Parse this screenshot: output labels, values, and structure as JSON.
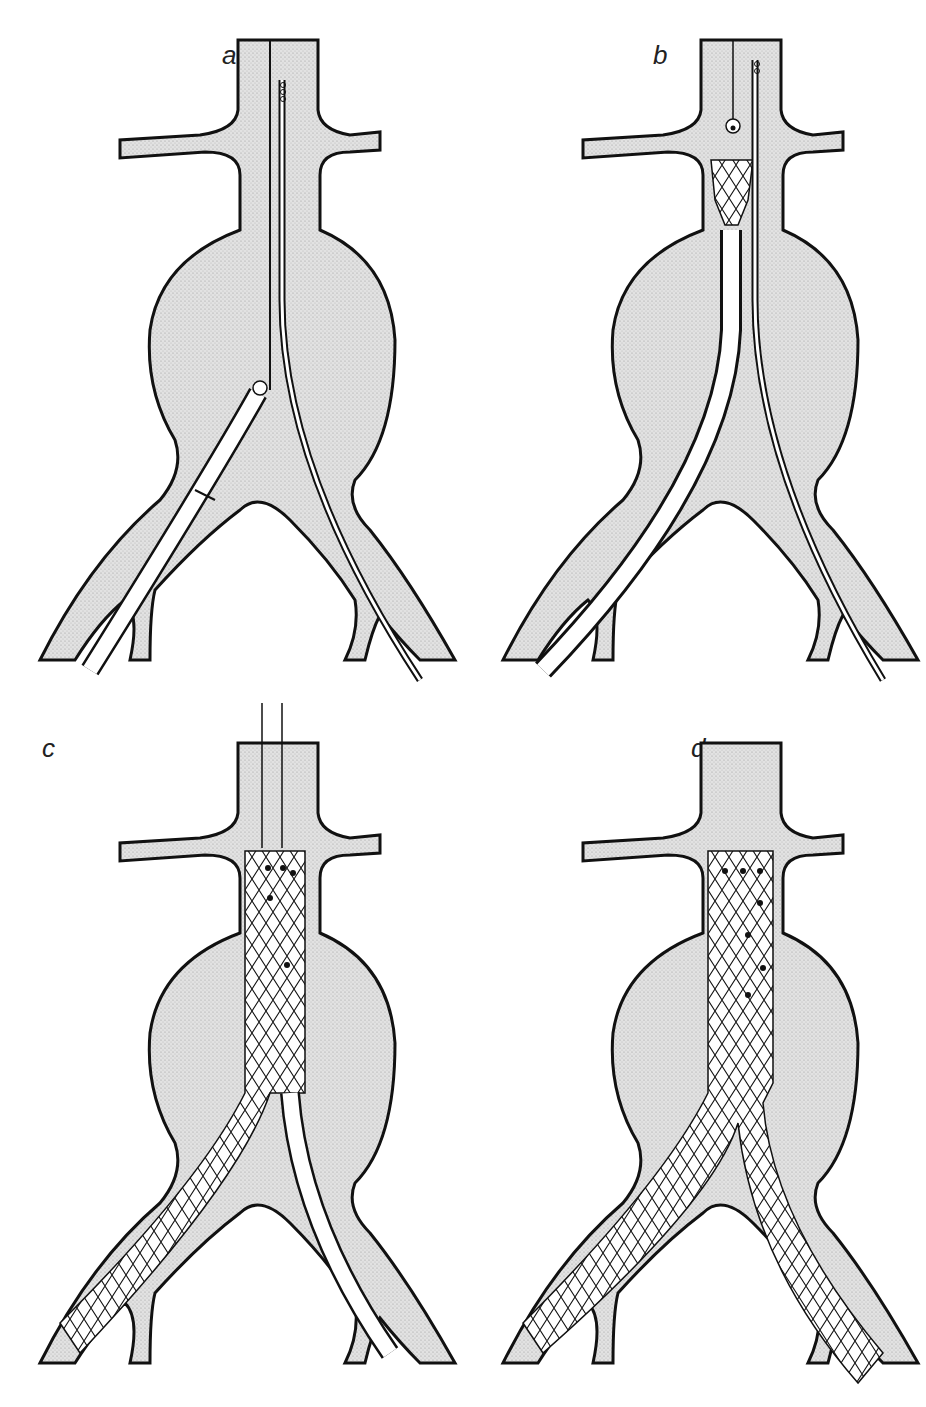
{
  "figure": {
    "panels": [
      {
        "id": "a",
        "label": "a",
        "description": "Guidewires introduced; delivery sheath advanced through right iliac artery into aneurysm"
      },
      {
        "id": "b",
        "label": "b",
        "description": "Stent graft deployment begins below renal arteries"
      },
      {
        "id": "c",
        "label": "c",
        "description": "Main body and ipsilateral limb deployed; contralateral sheath in left iliac"
      },
      {
        "id": "d",
        "label": "d",
        "description": "Completed bifurcated stent graft excluding the aneurysm"
      }
    ],
    "colors": {
      "vessel_fill": "#d9d9d9",
      "outline": "#1a1a1a",
      "background": "#ffffff"
    }
  }
}
